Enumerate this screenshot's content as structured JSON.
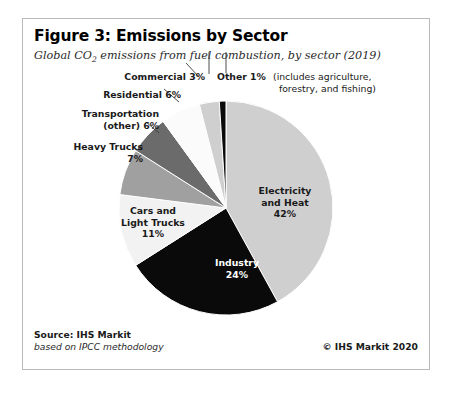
{
  "figure": {
    "title": "Figure 3: Emissions by Sector",
    "subtitle_before": "Global CO",
    "subtitle_sub": "2",
    "subtitle_after": " emissions from fuel combustion, by sector (2019)"
  },
  "footer": {
    "source": "Source: IHS Markit",
    "methodology": "based on IPCC methodology",
    "copyright": "© IHS Markit 2020"
  },
  "labels": {
    "electricity": "Electricity\nand Heat\n42%",
    "industry": "Industry\n24%",
    "cars": "Cars and\nLight Trucks\n11%",
    "heavy_trucks": "Heavy Trucks\n7%",
    "transportation": "Transportation\n(other) 6%",
    "residential": "Residential 6%",
    "commercial": "Commercial 3%",
    "other": "Other 1%",
    "other_note": "(includes agriculture,\n  forestry, and fishing)"
  },
  "chart_data": {
    "type": "pie",
    "title": "Figure 3: Emissions by Sector",
    "subtitle": "Global CO2 emissions from fuel combustion, by sector (2019)",
    "unit": "percent",
    "total": 100,
    "start_angle_deg": 0,
    "direction": "clockwise",
    "legend": "none (direct labels)",
    "categories": [
      "Electricity and Heat",
      "Industry",
      "Cars and Light Trucks",
      "Heavy Trucks",
      "Transportation (other)",
      "Residential",
      "Commercial",
      "Other"
    ],
    "values": [
      42,
      24,
      11,
      7,
      6,
      6,
      3,
      1
    ],
    "colors": [
      "#cfcfcf",
      "#0a0a0a",
      "#f2f2f2",
      "#a0a0a0",
      "#6b6b6b",
      "#fbfbfb",
      "#cfcfcf",
      "#0a0a0a"
    ],
    "label_colors": [
      "#1a1a1a",
      "#ffffff",
      "#1a1a1a",
      "#1a1a1a",
      "#1a1a1a",
      "#1a1a1a",
      "#1a1a1a",
      "#1a1a1a"
    ],
    "notes": {
      "Other": "includes agriculture, forestry, and fishing"
    },
    "source": "IHS Markit, based on IPCC methodology"
  },
  "style": {
    "card_border": "#b9b9b9",
    "background": "#ffffff",
    "pie_center_x": 203,
    "pie_center_y": 189,
    "pie_radius": 107
  }
}
